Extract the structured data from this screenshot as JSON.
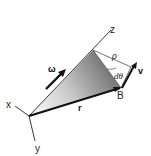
{
  "diagram": {
    "type": "rigid-body-rotation-kinematics",
    "labels": {
      "z_axis": "z",
      "x_axis": "x",
      "y_axis": "y",
      "omega": "ω",
      "rho": "ρ",
      "dtheta": "dθ",
      "velocity": "v",
      "point_b": "B",
      "position_vector": "r"
    },
    "colors": {
      "line": "#222222",
      "shade_dark": "#6e6e6e",
      "shade_light": "#f2f2f2",
      "background": "#ffffff"
    }
  }
}
